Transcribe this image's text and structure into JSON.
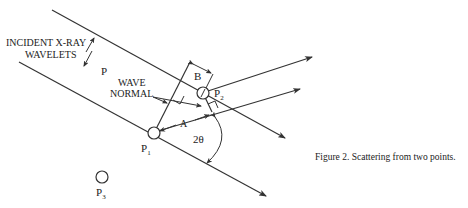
{
  "labels": {
    "incident_line1": "INCIDENT X-RAY",
    "incident_line2": "WAVELETS",
    "p": "P",
    "wave_normal_line1": "WAVE",
    "wave_normal_line2": "NORMAL",
    "b": "B",
    "a": "A",
    "angle": "2θ",
    "p1": "P",
    "p1_sub": "1",
    "p2": "P",
    "p2_sub": "2",
    "p3": "P",
    "p3_sub": "3"
  },
  "caption": "Figure 2.  Scattering from two points.",
  "colors": {
    "line": "#333333",
    "text": "#222222",
    "background": "#ffffff"
  }
}
